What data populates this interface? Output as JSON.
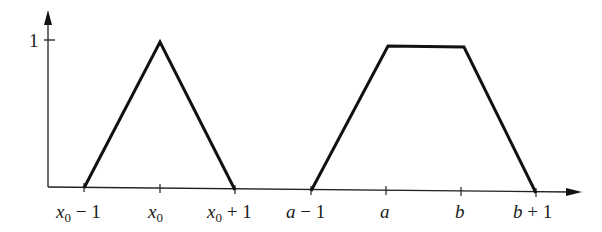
{
  "diagram": {
    "title": "",
    "y_axis": {
      "tick_label": "1"
    },
    "x_axis": {
      "ticks": [
        {
          "id": "x0m1",
          "var": "x",
          "sub": "0",
          "suffix": "− 1"
        },
        {
          "id": "x0",
          "var": "x",
          "sub": "0",
          "suffix": ""
        },
        {
          "id": "x0p1",
          "var": "x",
          "sub": "0",
          "suffix": "+ 1"
        },
        {
          "id": "am1",
          "var": "a",
          "sub": "",
          "suffix": "− 1"
        },
        {
          "id": "a",
          "var": "a",
          "sub": "",
          "suffix": ""
        },
        {
          "id": "b",
          "var": "b",
          "sub": "",
          "suffix": ""
        },
        {
          "id": "bp1",
          "var": "b",
          "sub": "",
          "suffix": "+ 1"
        }
      ]
    },
    "shapes": [
      {
        "name": "triangle",
        "points": [
          "x0-1,0",
          "x0,1",
          "x0+1,0"
        ]
      },
      {
        "name": "trapezoid",
        "points": [
          "a-1,0",
          "a,1",
          "b,1",
          "b+1,0"
        ]
      }
    ],
    "line_color": "#111111"
  }
}
